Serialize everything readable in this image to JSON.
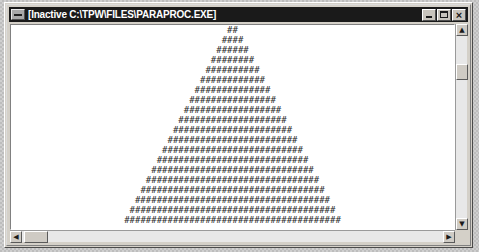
{
  "window": {
    "title": "[Inactive C:\\TPW\\FILES\\PARAPROC.EXE]",
    "sysmenu_label": "System Menu",
    "buttons": {
      "minimize": "Minimize",
      "maximize": "Maximize",
      "close": "Close"
    },
    "colors": {
      "titlebar_bg": "#1a1a1a",
      "titlebar_fg": "#ffffff",
      "frame_bg": "#d4d0c8",
      "client_bg": "#ffffff",
      "console_fg": "#2b2b2b",
      "scrollbar_track": "#e8e8e8",
      "scrollbar_thumb": "#cfcbc4"
    }
  },
  "scrollbars": {
    "vertical": {
      "up_arrow": "▲",
      "down_arrow": "▼",
      "thumb_position_pct": 18
    },
    "horizontal": {
      "left_arrow": "◀",
      "right_arrow": "▶",
      "thumb_position_pct": 3
    }
  },
  "console": {
    "glyph": "#",
    "rows": 20,
    "pattern": "centered-triangle-even-widths",
    "lines": [
      "##",
      "####",
      "######",
      "########",
      "##########",
      "############",
      "##############",
      "################",
      "##################",
      "####################",
      "######################",
      "########################",
      "##########################",
      "############################",
      "##############################",
      "################################",
      "##################################",
      "####################################",
      "######################################",
      "########################################"
    ]
  }
}
